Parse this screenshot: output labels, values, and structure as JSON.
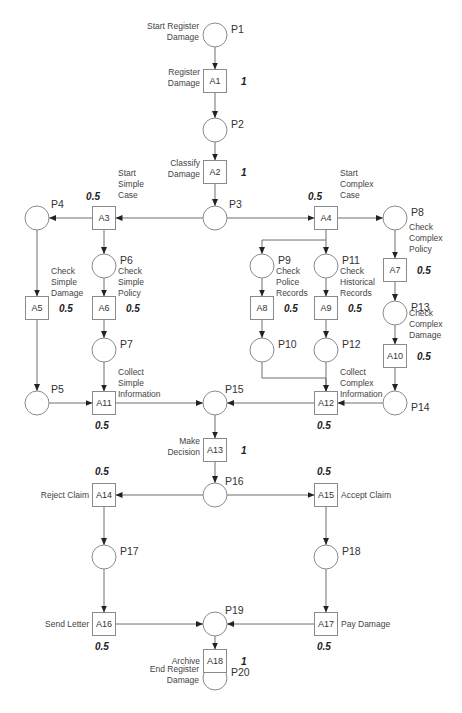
{
  "places": [
    {
      "id": "P1",
      "label": "P1",
      "desc": [
        "Start Register",
        "Damage"
      ]
    },
    {
      "id": "P2",
      "label": "P2",
      "desc": []
    },
    {
      "id": "P3",
      "label": "P3",
      "desc": []
    },
    {
      "id": "P4",
      "label": "P4",
      "desc": []
    },
    {
      "id": "P5",
      "label": "P5",
      "desc": []
    },
    {
      "id": "P6",
      "label": "P6",
      "desc": []
    },
    {
      "id": "P7",
      "label": "P7",
      "desc": []
    },
    {
      "id": "P8",
      "label": "P8",
      "desc": []
    },
    {
      "id": "P9",
      "label": "P9",
      "desc": []
    },
    {
      "id": "P10",
      "label": "P10",
      "desc": []
    },
    {
      "id": "P11",
      "label": "P11",
      "desc": []
    },
    {
      "id": "P12",
      "label": "P12",
      "desc": []
    },
    {
      "id": "P13",
      "label": "P13",
      "desc": []
    },
    {
      "id": "P14",
      "label": "P14",
      "desc": []
    },
    {
      "id": "P15",
      "label": "P15",
      "desc": []
    },
    {
      "id": "P16",
      "label": "P16",
      "desc": []
    },
    {
      "id": "P17",
      "label": "P17",
      "desc": []
    },
    {
      "id": "P18",
      "label": "P18",
      "desc": []
    },
    {
      "id": "P19",
      "label": "P19",
      "desc": []
    },
    {
      "id": "P20",
      "label": "P20",
      "desc": [
        "End Register",
        "Damage"
      ]
    }
  ],
  "transitions": [
    {
      "id": "A1",
      "label": "A1",
      "desc": [
        "Register",
        "Damage"
      ],
      "prob": "1"
    },
    {
      "id": "A2",
      "label": "A2",
      "desc": [
        "Classify",
        "Damage"
      ],
      "prob": "1"
    },
    {
      "id": "A3",
      "label": "A3",
      "desc": [
        "Start",
        "Simple",
        "Case"
      ],
      "prob": "0.5"
    },
    {
      "id": "A4",
      "label": "A4",
      "desc": [
        "Start",
        "Complex",
        "Case"
      ],
      "prob": "0.5"
    },
    {
      "id": "A5",
      "label": "A5",
      "desc": [
        "Check",
        "Simple",
        "Damage"
      ],
      "prob": "0.5"
    },
    {
      "id": "A6",
      "label": "A6",
      "desc": [
        "Check",
        "Simple",
        "Policy"
      ],
      "prob": "0.5"
    },
    {
      "id": "A7",
      "label": "A7",
      "desc": [
        "Check",
        "Complex",
        "Policy"
      ],
      "prob": "0.5"
    },
    {
      "id": "A8",
      "label": "A8",
      "desc": [
        "Check",
        "Police",
        "Records"
      ],
      "prob": "0.5"
    },
    {
      "id": "A9",
      "label": "A9",
      "desc": [
        "Check",
        "Historical",
        "Records"
      ],
      "prob": "0.5"
    },
    {
      "id": "A10",
      "label": "A10",
      "desc": [
        "Check",
        "Complex",
        "Damage"
      ],
      "prob": "0.5"
    },
    {
      "id": "A11",
      "label": "A11",
      "desc": [
        "Collect",
        "Simple",
        "Information"
      ],
      "prob": "0.5"
    },
    {
      "id": "A12",
      "label": "A12",
      "desc": [
        "Collect",
        "Complex",
        "Information"
      ],
      "prob": "0.5"
    },
    {
      "id": "A13",
      "label": "A13",
      "desc": [
        "Make",
        "Decision"
      ],
      "prob": "1"
    },
    {
      "id": "A14",
      "label": "A14",
      "desc": [
        "Reject Claim"
      ],
      "prob": "0.5"
    },
    {
      "id": "A15",
      "label": "A15",
      "desc": [
        "Accept Claim"
      ],
      "prob": "0.5"
    },
    {
      "id": "A16",
      "label": "A16",
      "desc": [
        "Send Letter"
      ],
      "prob": "0.5"
    },
    {
      "id": "A17",
      "label": "A17",
      "desc": [
        "Pay Damage"
      ],
      "prob": "0.5"
    },
    {
      "id": "A18",
      "label": "A18",
      "desc": [
        "Archive"
      ],
      "prob": "1"
    }
  ],
  "arcs": [
    [
      "P1",
      "A1"
    ],
    [
      "A1",
      "P2"
    ],
    [
      "P2",
      "A2"
    ],
    [
      "A2",
      "P3"
    ],
    [
      "P3",
      "A3"
    ],
    [
      "P3",
      "A4"
    ],
    [
      "A3",
      "P4"
    ],
    [
      "A3",
      "P6"
    ],
    [
      "A4",
      "P8"
    ],
    [
      "A4",
      "P9"
    ],
    [
      "A4",
      "P11"
    ],
    [
      "P4",
      "A5"
    ],
    [
      "P6",
      "A6"
    ],
    [
      "P8",
      "A7"
    ],
    [
      "P9",
      "A8"
    ],
    [
      "P11",
      "A9"
    ],
    [
      "A5",
      "P5"
    ],
    [
      "A6",
      "P7"
    ],
    [
      "A7",
      "P13"
    ],
    [
      "A8",
      "P10"
    ],
    [
      "A9",
      "P12"
    ],
    [
      "P13",
      "A10"
    ],
    [
      "A10",
      "P14"
    ],
    [
      "P5",
      "A11"
    ],
    [
      "P7",
      "A11"
    ],
    [
      "A11",
      "P15"
    ],
    [
      "P10",
      "A12"
    ],
    [
      "P12",
      "A12"
    ],
    [
      "P14",
      "A12"
    ],
    [
      "A12",
      "P15"
    ],
    [
      "P15",
      "A13"
    ],
    [
      "A13",
      "P16"
    ],
    [
      "P16",
      "A14"
    ],
    [
      "P16",
      "A15"
    ],
    [
      "A14",
      "P17"
    ],
    [
      "A15",
      "P18"
    ],
    [
      "P17",
      "A16"
    ],
    [
      "P18",
      "A17"
    ],
    [
      "A16",
      "P19"
    ],
    [
      "A17",
      "P19"
    ],
    [
      "P19",
      "A18"
    ],
    [
      "A18",
      "P20"
    ]
  ]
}
